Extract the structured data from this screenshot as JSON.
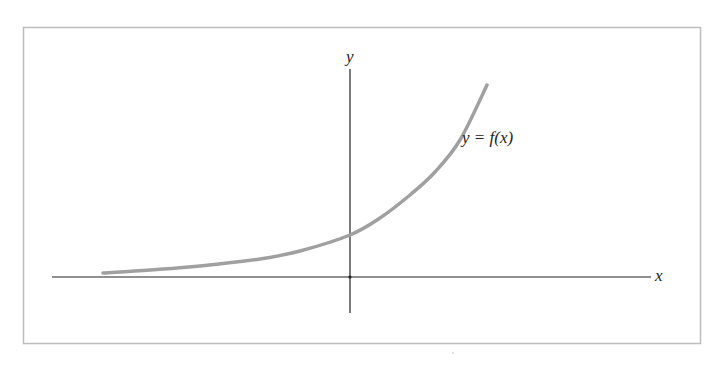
{
  "chart_data": {
    "type": "line",
    "title": "",
    "xlabel": "x",
    "ylabel": "y",
    "curve_label": "y = f(x)",
    "grid": false,
    "ticks": false,
    "legend": "inline label near curve",
    "pixel_points": [
      [
        103,
        273
      ],
      [
        150,
        270
      ],
      [
        200,
        266
      ],
      [
        260,
        259
      ],
      [
        300,
        251
      ],
      [
        350,
        235
      ],
      [
        380,
        218
      ],
      [
        410,
        195
      ],
      [
        435,
        172
      ],
      [
        460,
        140
      ],
      [
        487,
        85
      ]
    ],
    "approx_shape": "y = a * e^(kx), a > 0, k > 0"
  },
  "colors": {
    "frame": "#bdbdbd",
    "axes": "#222222",
    "curve": "#a0a0a0",
    "text": "#222222"
  },
  "labels": {
    "x_axis": "x",
    "y_axis": "y",
    "curve": "y = f(x)"
  }
}
